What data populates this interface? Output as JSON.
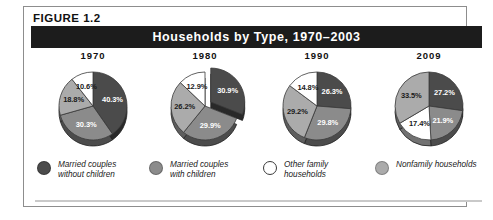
{
  "figure": {
    "label": "FIGURE  1.2",
    "title": "Households by Type, 1970–2003"
  },
  "colors": {
    "dark": "#4b4b4b",
    "medium": "#8b8b8b",
    "light": "#ababab",
    "white": "#ffffff",
    "title_bar": "#1c1c1c",
    "frame": "#8d8d8d",
    "outline": "#3a3a3a"
  },
  "legend": {
    "items": [
      {
        "name": "married-couples-without-children",
        "label": "Married couples\nwithout children",
        "color": "#4b4b4b",
        "outlined": false
      },
      {
        "name": "married-couples-with-children",
        "label": "Married couples\nwith children",
        "color": "#8b8b8b",
        "outlined": false
      },
      {
        "name": "other-family-households",
        "label": "Other family\nhouseholds",
        "color": "#ffffff",
        "outlined": true
      },
      {
        "name": "nonfamily-households",
        "label": "Nonfamily households",
        "color": "#ababab",
        "outlined": false
      }
    ]
  },
  "chart_data": {
    "type": "pie",
    "title": "Households by Type, 1970–2003",
    "xlabel": "",
    "ylabel": "",
    "legend_position": "bottom",
    "units": "percent",
    "categories": [
      "Married couples without children",
      "Married couples with children",
      "Other family households",
      "Nonfamily households"
    ],
    "charts": [
      {
        "title": "1970",
        "exploded": false,
        "slices": [
          {
            "category": "Married couples without children",
            "value": 40.3,
            "label": "40.3%",
            "color": "#4b4b4b"
          },
          {
            "category": "Married couples with children",
            "value": 30.3,
            "label": "30.3%",
            "color": "#8b8b8b"
          },
          {
            "category": "Nonfamily households",
            "value": 18.8,
            "label": "18.8%",
            "color": "#ababab"
          },
          {
            "category": "Other family households",
            "value": 10.6,
            "label": "10.6%",
            "color": "#ffffff"
          }
        ]
      },
      {
        "title": "1980",
        "exploded": true,
        "slices": [
          {
            "category": "Married couples without children",
            "value": 30.9,
            "label": "30.9%",
            "color": "#4b4b4b"
          },
          {
            "category": "Married couples with children",
            "value": 29.9,
            "label": "29.9%",
            "color": "#8b8b8b"
          },
          {
            "category": "Nonfamily households",
            "value": 26.2,
            "label": "26.2%",
            "color": "#ababab"
          },
          {
            "category": "Other family households",
            "value": 12.9,
            "label": "12.9%",
            "color": "#ffffff"
          }
        ]
      },
      {
        "title": "1990",
        "exploded": false,
        "slices": [
          {
            "category": "Married couples without children",
            "value": 26.3,
            "label": "26.3%",
            "color": "#4b4b4b"
          },
          {
            "category": "Married couples with children",
            "value": 29.8,
            "label": "29.8%",
            "color": "#8b8b8b"
          },
          {
            "category": "Nonfamily households",
            "value": 29.2,
            "label": "29.2%",
            "color": "#ababab"
          },
          {
            "category": "Other family households",
            "value": 14.8,
            "label": "14.8%",
            "color": "#ffffff"
          }
        ]
      },
      {
        "title": "2009",
        "exploded": false,
        "slices": [
          {
            "category": "Married couples without children",
            "value": 27.2,
            "label": "27.2%",
            "color": "#4b4b4b"
          },
          {
            "category": "Married couples with children",
            "value": 21.9,
            "label": "21.9%",
            "color": "#8b8b8b"
          },
          {
            "category": "Other family households",
            "value": 17.4,
            "label": "17.4%",
            "color": "#ffffff"
          },
          {
            "category": "Nonfamily households",
            "value": 33.5,
            "label": "33.5%",
            "color": "#ababab"
          }
        ]
      }
    ]
  }
}
